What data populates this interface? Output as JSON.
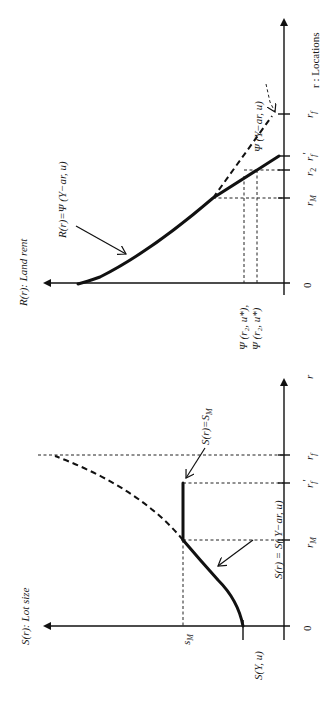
{
  "figure": {
    "orientation": "rotated-90-ccw",
    "top_panel": {
      "y_axis_label": "R(r): Land rent",
      "x_axis_label": "r : Locations",
      "origin_label": "0",
      "x_ticks": [
        "r_M",
        "r_2",
        "r_f'",
        "r_f"
      ],
      "x_tick_labels": {
        "rM": "r",
        "rM_sub": "M",
        "r2": "r",
        "r2_sub": "2",
        "rfp": "r",
        "rfp_sub": "f",
        "rfp_prime": "′",
        "rf": "r",
        "rf_sub": "f"
      },
      "y_tick_labels": [
        "Ψ (r₂, u*),",
        "Ψ (r₂, u*)"
      ],
      "annotations": {
        "rent_curve": "R(r)=Ψ (Y−ar, u)",
        "bid_rent_dashed": "Ψ (Y−ar, u)"
      }
    },
    "bottom_panel": {
      "y_axis_label": "S(r): Lot size",
      "x_axis_label": "r",
      "origin_label": "0",
      "x_ticks": [
        "r_M",
        "r_f'",
        "r_f"
      ],
      "x_tick_labels": {
        "rM": "r",
        "rM_sub": "M",
        "rfp": "r",
        "rfp_sub": "f",
        "rfp_prime": "′",
        "rf": "r",
        "rf_sub": "f"
      },
      "y_tick_labels": {
        "sM": "s",
        "sM_sub": "M",
        "sY": "S(Y, u)"
      },
      "annotations": {
        "lot_curve": "S(r) = S( Y−ar, u)",
        "cap_segment": "S(r)=S",
        "cap_segment_sub": "M"
      }
    }
  },
  "colors": {
    "ink": "#111111",
    "background": "#ffffff"
  }
}
